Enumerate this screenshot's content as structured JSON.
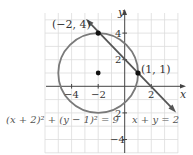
{
  "figure": {
    "axes": {
      "x_label": "x",
      "y_label": "y"
    },
    "ticks": {
      "x": [
        {
          "value": -4,
          "label": "−4"
        },
        {
          "value": -2,
          "label": "−2"
        },
        {
          "value": 2,
          "label": "2"
        }
      ],
      "y": [
        {
          "value": 4,
          "label": "4"
        },
        {
          "value": 2,
          "label": "2"
        },
        {
          "value": -2,
          "label": "2"
        },
        {
          "value": -4,
          "label": "−4"
        }
      ]
    },
    "points": [
      {
        "label": "(−2, 4)",
        "x": -2,
        "y": 4
      },
      {
        "label": "(1, 1)",
        "x": 1,
        "y": 1
      },
      {
        "label": "",
        "x": -2,
        "y": 1,
        "role": "center"
      }
    ],
    "circle": {
      "equation": "(x + 2)² + (y − 1)² = 9",
      "center": [
        -2,
        1
      ],
      "radius": 3
    },
    "line": {
      "equation": "x + y = 2"
    },
    "colors": {
      "curve": "#777777",
      "line": "#555555",
      "grid": "#d8d8d8",
      "axis": "#444444",
      "point": "#111111"
    }
  }
}
